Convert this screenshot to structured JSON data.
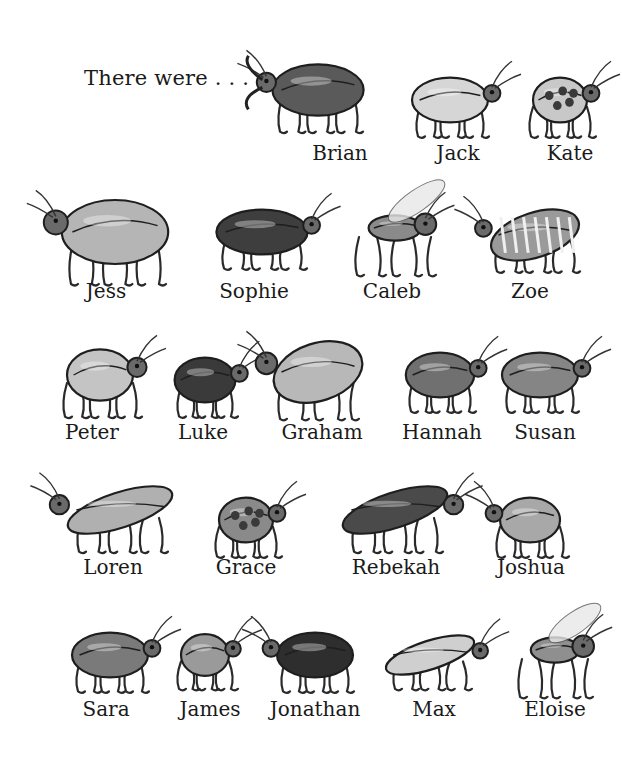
{
  "intro_text": "There were . . .",
  "bugs": [
    {
      "name": "Brian",
      "x": 340,
      "y": 158,
      "type": "stag",
      "cx": 318,
      "cy": 90,
      "w": 120,
      "h": 80,
      "shade": "#5a5a5a"
    },
    {
      "name": "Jack",
      "x": 458,
      "y": 158,
      "type": "hopper",
      "cx": 450,
      "cy": 100,
      "w": 100,
      "h": 70,
      "shade": "#d6d6d6"
    },
    {
      "name": "Kate",
      "x": 570,
      "y": 158,
      "type": "ladybug",
      "cx": 560,
      "cy": 100,
      "w": 90,
      "h": 70,
      "shade": "#c8c8c8"
    },
    {
      "name": "Jess",
      "x": 106,
      "y": 296,
      "type": "shield",
      "cx": 115,
      "cy": 232,
      "w": 140,
      "h": 100,
      "shade": "#b5b5b5"
    },
    {
      "name": "Sophie",
      "x": 254,
      "y": 296,
      "type": "beetle",
      "cx": 262,
      "cy": 232,
      "w": 120,
      "h": 70,
      "shade": "#3e3e3e"
    },
    {
      "name": "Caleb",
      "x": 392,
      "y": 296,
      "type": "fly",
      "cx": 395,
      "cy": 228,
      "w": 120,
      "h": 90,
      "shade": "#8a8a8a"
    },
    {
      "name": "Zoe",
      "x": 530,
      "y": 296,
      "type": "striped",
      "cx": 535,
      "cy": 235,
      "w": 120,
      "h": 70,
      "shade": "#9a9a9a"
    },
    {
      "name": "Peter",
      "x": 92,
      "y": 437,
      "type": "round",
      "cx": 100,
      "cy": 375,
      "w": 110,
      "h": 80,
      "shade": "#c4c4c4"
    },
    {
      "name": "Luke",
      "x": 203,
      "y": 437,
      "type": "beetle",
      "cx": 205,
      "cy": 380,
      "w": 80,
      "h": 70,
      "shade": "#3a3a3a"
    },
    {
      "name": "Graham",
      "x": 322,
      "y": 437,
      "type": "grasshopper",
      "cx": 318,
      "cy": 372,
      "w": 120,
      "h": 90,
      "shade": "#b8b8b8"
    },
    {
      "name": "Hannah",
      "x": 442,
      "y": 437,
      "type": "beetle",
      "cx": 440,
      "cy": 375,
      "w": 90,
      "h": 70,
      "shade": "#707070"
    },
    {
      "name": "Susan",
      "x": 545,
      "y": 437,
      "type": "beetle",
      "cx": 540,
      "cy": 375,
      "w": 100,
      "h": 70,
      "shade": "#858585"
    },
    {
      "name": "Loren",
      "x": 113,
      "y": 572,
      "type": "long",
      "cx": 120,
      "cy": 510,
      "w": 130,
      "h": 80,
      "shade": "#b0b0b0"
    },
    {
      "name": "Grace",
      "x": 246,
      "y": 572,
      "type": "ladybug",
      "cx": 246,
      "cy": 520,
      "w": 90,
      "h": 70,
      "shade": "#8a8a8a"
    },
    {
      "name": "Rebekah",
      "x": 396,
      "y": 572,
      "type": "longhorn",
      "cx": 395,
      "cy": 510,
      "w": 130,
      "h": 80,
      "shade": "#4a4a4a"
    },
    {
      "name": "Joshua",
      "x": 531,
      "y": 572,
      "type": "round",
      "cx": 530,
      "cy": 520,
      "w": 100,
      "h": 70,
      "shade": "#a8a8a8"
    },
    {
      "name": "Sara",
      "x": 106,
      "y": 714,
      "type": "beetle",
      "cx": 110,
      "cy": 655,
      "w": 100,
      "h": 70,
      "shade": "#7a7a7a"
    },
    {
      "name": "James",
      "x": 210,
      "y": 714,
      "type": "round",
      "cx": 205,
      "cy": 655,
      "w": 80,
      "h": 65,
      "shade": "#9a9a9a"
    },
    {
      "name": "Jonathan",
      "x": 315,
      "y": 714,
      "type": "beetle",
      "cx": 315,
      "cy": 655,
      "w": 100,
      "h": 70,
      "shade": "#2e2e2e"
    },
    {
      "name": "Max",
      "x": 434,
      "y": 714,
      "type": "long",
      "cx": 430,
      "cy": 655,
      "w": 110,
      "h": 65,
      "shade": "#cfcfcf"
    },
    {
      "name": "Eloise",
      "x": 555,
      "y": 714,
      "type": "fly",
      "cx": 555,
      "cy": 650,
      "w": 110,
      "h": 90,
      "shade": "#8f8f8f"
    }
  ]
}
